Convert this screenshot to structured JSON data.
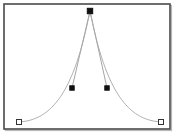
{
  "app": {
    "title": "Bezier Curve Editor",
    "panel_name": "curve-canvas"
  },
  "canvas": {
    "width": 176,
    "height": 135,
    "background_color": "#ffffff",
    "frame": {
      "x": 4,
      "y": 4,
      "width": 166,
      "height": 125,
      "border_color": "#4a4a4a",
      "border_width": 1.6,
      "shadow_color": "#b8b8b8"
    }
  },
  "chart_data": {
    "type": "line",
    "title": "",
    "xlabel": "",
    "ylabel": "",
    "xlim": [
      0,
      176
    ],
    "ylim": [
      135,
      0
    ],
    "grid": false,
    "legend": null,
    "curve_color": "#a8a8a8",
    "curve_width": 0.9,
    "tangent_color": "#9a9a9a",
    "tangent_width": 0.9,
    "series": [
      {
        "name": "bezier-path",
        "path": "M 19 122 C 52 120, 74 92, 90 11 C 106 92, 128 120, 161 122"
      }
    ],
    "nodes": [
      {
        "id": "endpoint-left",
        "label": "Start point",
        "x": 19,
        "y": 122,
        "shape": "square-open",
        "size": 5,
        "fill": "#ffffff",
        "stroke": "#333333",
        "selected": false
      },
      {
        "id": "handle-left",
        "label": "Left control handle",
        "x": 72,
        "y": 88,
        "shape": "square-filled",
        "size": 4.4,
        "fill": "#111111",
        "stroke": "#111111",
        "selected": true
      },
      {
        "id": "apex-node",
        "label": "Peak anchor point",
        "x": 90,
        "y": 11,
        "shape": "square-filled",
        "size": 5.4,
        "fill": "#111111",
        "stroke": "#111111",
        "selected": true
      },
      {
        "id": "handle-right",
        "label": "Right control handle",
        "x": 107,
        "y": 88,
        "shape": "square-filled",
        "size": 4.4,
        "fill": "#111111",
        "stroke": "#111111",
        "selected": true
      },
      {
        "id": "endpoint-right",
        "label": "End point",
        "x": 161,
        "y": 122,
        "shape": "square-open",
        "size": 5,
        "fill": "#ffffff",
        "stroke": "#333333",
        "selected": false
      }
    ],
    "tangents": [
      {
        "id": "tangent-left",
        "label": "Apex to left handle",
        "x1": 90,
        "y1": 11,
        "x2": 72,
        "y2": 88
      },
      {
        "id": "tangent-right",
        "label": "Apex to right handle",
        "x1": 90,
        "y1": 11,
        "x2": 107,
        "y2": 88
      }
    ]
  }
}
